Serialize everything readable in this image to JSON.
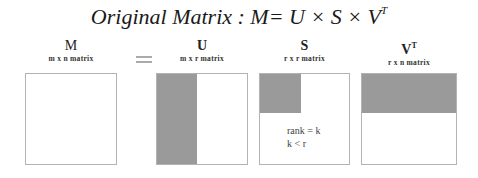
{
  "title": {
    "prefix": "Original Matrix : M= U × S × V",
    "superscript": "T"
  },
  "equals_symbol": "=",
  "matrices": [
    {
      "name": "M",
      "superscript": "",
      "dims": "m x n matrix"
    },
    {
      "name": "U",
      "superscript": "",
      "dims": "m x r matrix"
    },
    {
      "name": "S",
      "superscript": "",
      "dims": "r x r matrix"
    },
    {
      "name": "V",
      "superscript": "T",
      "dims": "r x n matrix"
    }
  ],
  "annotation": {
    "line1": "rank = k",
    "line2": "k < r"
  },
  "colors": {
    "shade": "#9a9a9a",
    "border": "#b3b3b3"
  }
}
